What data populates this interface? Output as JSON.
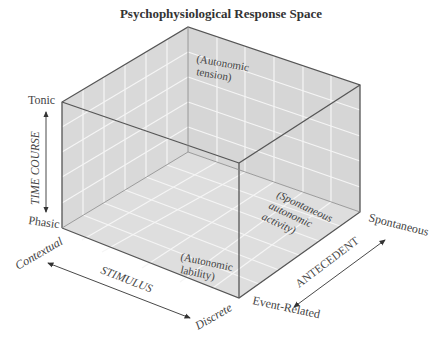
{
  "title": "Psychophysiological Response Space",
  "axes": {
    "time_course": {
      "label": "TIME COURSE",
      "high": "Tonic",
      "low": "Phasic"
    },
    "stimulus": {
      "label": "STIMULUS",
      "start": "Contextual",
      "end": "Discrete"
    },
    "antecedent": {
      "label": "ANTECEDENT",
      "start": "Event-Related",
      "end": "Spontaneous"
    }
  },
  "regions": {
    "tension": {
      "line1": "(Autonomic",
      "line2": "tension)"
    },
    "spontaneous": {
      "line1": "(Spontaneous",
      "line2": "autonomic",
      "line3": "activity)"
    },
    "lability": {
      "line1": "(Autonomic",
      "line2": "lability)"
    }
  },
  "colors": {
    "face": "#dcdcdc",
    "grid": "#f4f4f4",
    "edge": "#555555",
    "text": "#444444"
  }
}
